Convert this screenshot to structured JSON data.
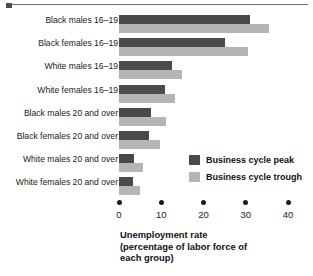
{
  "figure": {
    "top_rule": {
      "marker": "square-marker"
    }
  },
  "chart_data": {
    "type": "bar",
    "orientation": "horizontal",
    "title": "",
    "xlabel_lines": [
      "Unemployment rate",
      "(percentage of labor force of",
      "each group)"
    ],
    "ylabel": "",
    "xlim": [
      0,
      40
    ],
    "xticks": [
      0,
      10,
      20,
      30,
      40
    ],
    "xtick_labels": [
      "0",
      "10",
      "20",
      "30",
      "40"
    ],
    "grid": false,
    "legend_position": "inside-right",
    "categories": [
      "Black males 16–19",
      "Black females 16–19",
      "White males 16–19",
      "White females 16–19",
      "Black males 20 and over",
      "Black females 20 and over",
      "White males 20 and over",
      "White females 20 and over"
    ],
    "series": [
      {
        "name": "Business cycle peak",
        "color": "#4a4a4a",
        "values": [
          31.0,
          25.0,
          12.6,
          10.8,
          7.6,
          7.2,
          3.6,
          3.2
        ]
      },
      {
        "name": "Business cycle trough",
        "color": "#b5b5b5",
        "values": [
          35.5,
          30.5,
          15.0,
          13.2,
          11.2,
          9.6,
          5.6,
          4.9
        ]
      }
    ]
  },
  "legend": {
    "items": [
      {
        "label": "Business cycle peak",
        "swatch": "peak"
      },
      {
        "label": "Business cycle trough",
        "swatch": "trough"
      }
    ]
  }
}
